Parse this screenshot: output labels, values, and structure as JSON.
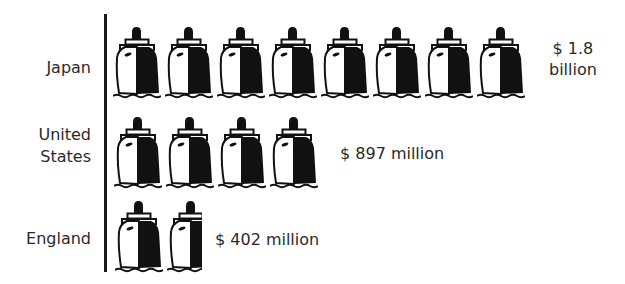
{
  "chart_data": {
    "type": "pictograph",
    "title": "",
    "icon": "ship-icon",
    "unit_per_icon_millions": 225,
    "orientation": "horizontal",
    "categories": [
      "Japan",
      "United States",
      "England"
    ],
    "values_millions": [
      1800,
      897,
      402
    ],
    "icon_counts": [
      8,
      4,
      1.8
    ],
    "value_labels": [
      "$ 1.8\nbillion",
      "$ 897  million",
      "$ 402  million"
    ],
    "xlabel": "",
    "ylabel": "",
    "grid": false,
    "legend": null
  },
  "rows": [
    {
      "label": "Japan",
      "value_text": "$ 1.8\nbillion",
      "full_icons": 8,
      "partial_fraction": 0
    },
    {
      "label": "United\nStates",
      "value_text": "$ 897  million",
      "full_icons": 4,
      "partial_fraction": 0
    },
    {
      "label": "England",
      "value_text": "$ 402  million",
      "full_icons": 1,
      "partial_fraction": 0.72
    }
  ],
  "colors": {
    "ink": "#111111",
    "text": "#2a2a2a",
    "background": "#ffffff"
  }
}
